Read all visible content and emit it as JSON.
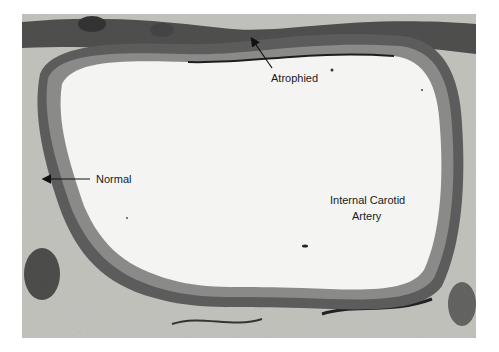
{
  "figure": {
    "labels": {
      "atrophied": "Atrophied",
      "normal": "Normal",
      "vessel_line1": "Internal Carotid",
      "vessel_line2": "Artery"
    },
    "colors": {
      "background": "#ffffff",
      "lumen": "#f4f4f2",
      "wall_dark": "#2a2a2a",
      "wall_mid": "#6e6e6e",
      "tissue_light": "#cfcfcb"
    }
  }
}
